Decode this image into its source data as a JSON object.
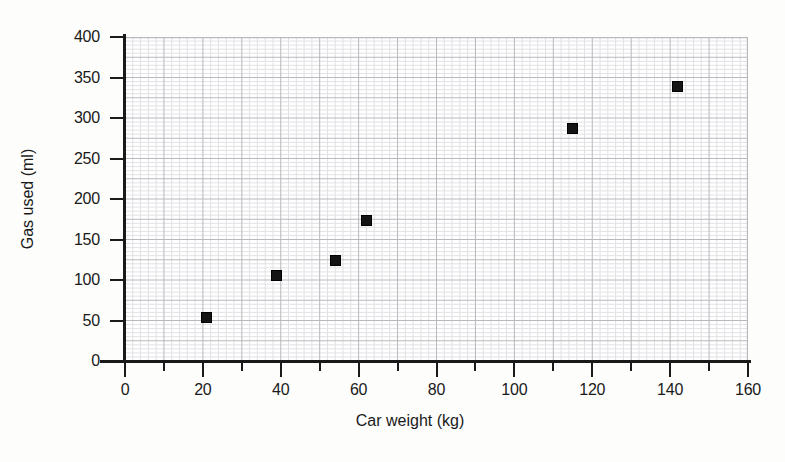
{
  "chart_data": {
    "type": "scatter",
    "title": "",
    "xlabel": "Car weight (kg)",
    "ylabel": "Gas used (ml)",
    "xlim": [
      0,
      160
    ],
    "ylim": [
      0,
      400
    ],
    "x_major_ticks": [
      0,
      20,
      40,
      60,
      80,
      100,
      120,
      140,
      160
    ],
    "x_minor_ticks": [
      10,
      30,
      50,
      70,
      90,
      110,
      130,
      150
    ],
    "x_tick_labels": [
      "0",
      "20",
      "40",
      "60",
      "80",
      "100",
      "120",
      "140",
      "160"
    ],
    "y_major_ticks": [
      0,
      50,
      100,
      150,
      200,
      250,
      300,
      350,
      400
    ],
    "y_tick_labels": [
      "0",
      "50",
      "100",
      "150",
      "200",
      "250",
      "300",
      "350",
      "400"
    ],
    "grid": true,
    "grid_major_step_x": 10,
    "grid_major_step_y": 25,
    "grid_minor_step_x": 2,
    "grid_minor_step_y": 5,
    "legend": "none",
    "marker": "square",
    "marker_color": "#141414",
    "points": [
      {
        "x": 21,
        "y": 54
      },
      {
        "x": 39,
        "y": 106
      },
      {
        "x": 54,
        "y": 124
      },
      {
        "x": 62,
        "y": 173
      },
      {
        "x": 115,
        "y": 287
      },
      {
        "x": 142,
        "y": 339
      }
    ],
    "series": [
      {
        "name": "Gas used vs car weight",
        "x": [
          21,
          39,
          54,
          62,
          115,
          142
        ],
        "values": [
          54,
          106,
          124,
          173,
          287,
          339
        ]
      }
    ]
  },
  "colors": {
    "background": "#fdfdfc",
    "plot_background": "#ffffff",
    "axis": "#1a1a1a",
    "grid_major": "#b8b8bd",
    "grid_minor": "#e2e2e6",
    "marker": "#141414",
    "text": "#1a1a1a"
  }
}
